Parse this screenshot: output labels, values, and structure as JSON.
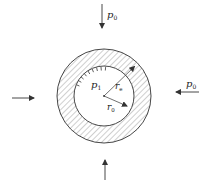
{
  "diagram": {
    "type": "thick-walled cylinder under pressure",
    "colors": {
      "stroke": "#333333",
      "hatch": "#777777",
      "background": "#ffffff"
    },
    "geometry": {
      "center": [
        104,
        96
      ],
      "outer_radius": 47,
      "inner_radius": 30
    },
    "labels": {
      "p_top": {
        "main": "p",
        "sub": "0"
      },
      "p_right": {
        "main": "p",
        "sub": "0"
      },
      "p_inner": {
        "main": "p",
        "sub": "1"
      },
      "r_e": {
        "main": "r",
        "sub": "e"
      },
      "r_0": {
        "main": "r",
        "sub": "0"
      }
    },
    "arrows": [
      {
        "name": "top-load-arrow",
        "direction": "down"
      },
      {
        "name": "right-load-arrow",
        "direction": "left"
      },
      {
        "name": "left-load-arrow",
        "direction": "right"
      },
      {
        "name": "bottom-load-arrow",
        "direction": "up"
      }
    ]
  }
}
